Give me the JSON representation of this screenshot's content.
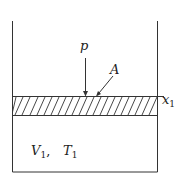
{
  "diagram": {
    "type": "piston-cylinder",
    "labels": {
      "pressure": "p",
      "area": "A",
      "position": "x",
      "position_sub": "1",
      "volume": "V",
      "volume_sub": "1",
      "separator": ",",
      "temperature": "T",
      "temperature_sub": "1"
    },
    "colors": {
      "line": "#333333",
      "background": "#ffffff"
    }
  }
}
